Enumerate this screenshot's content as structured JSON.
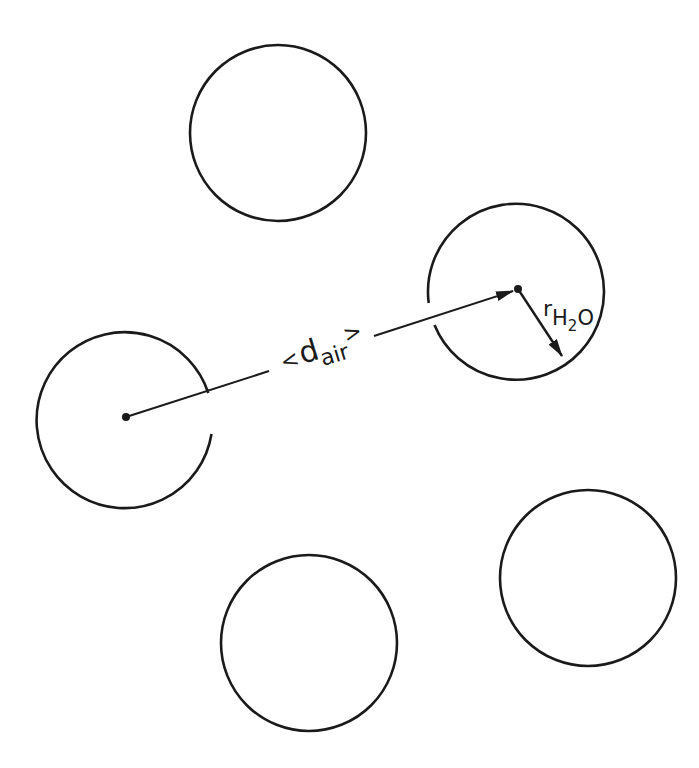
{
  "diagram": {
    "stroke_color": "#1a1a1a",
    "background": "#ffffff",
    "molecules": [
      {
        "id": "top",
        "cx": 278,
        "cy": 133,
        "r": 88
      },
      {
        "id": "left",
        "cx": 124,
        "cy": 417,
        "r": 88,
        "has_center": true
      },
      {
        "id": "right",
        "cx": 515,
        "cy": 289,
        "r": 88,
        "has_center": true
      },
      {
        "id": "bottom-right",
        "cx": 588,
        "cy": 578,
        "r": 88
      },
      {
        "id": "bottom",
        "cx": 309,
        "cy": 643,
        "r": 88
      }
    ],
    "distance_label": {
      "open": "<",
      "symbol": "d",
      "subscript": "air",
      "close": ">",
      "meaning": "mean distance between molecules"
    },
    "radius_label": {
      "symbol": "r",
      "subscript_pre": "H",
      "subscript_num": "2",
      "subscript_post": "O",
      "meaning": "radius of water molecule"
    }
  }
}
